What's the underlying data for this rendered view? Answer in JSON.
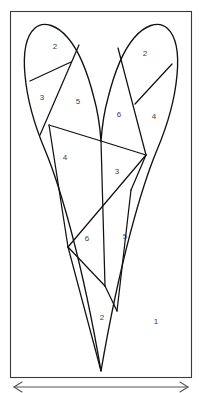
{
  "figure": {
    "canvas": {
      "width": 202,
      "height": 393
    },
    "frame": {
      "x": 10,
      "y": 11,
      "width": 182,
      "height": 367,
      "stroke": "#3a3a3a"
    },
    "colors": {
      "background": "#ffffff",
      "outline": "#111111",
      "cut_line": "#111111",
      "label_text": "#3c3c46",
      "frame": "#3a3a3a",
      "scale_arrow": "#555555"
    },
    "piece_labels": [
      {
        "id": "piece-1",
        "text": "1",
        "x": 156,
        "y": 322
      },
      {
        "id": "piece-2-left",
        "text": "2",
        "x": 55,
        "y": 47
      },
      {
        "id": "piece-3-left",
        "text": "3",
        "x": 42,
        "y": 98
      },
      {
        "id": "piece-5-left",
        "text": "5",
        "x": 78,
        "y": 102
      },
      {
        "id": "piece-2-right",
        "text": "2",
        "x": 145,
        "y": 54
      },
      {
        "id": "piece-6-upper",
        "text": "6",
        "x": 119,
        "y": 115
      },
      {
        "id": "piece-4-right",
        "text": "4",
        "x": 154,
        "y": 117
      },
      {
        "id": "piece-4-lower",
        "text": "4",
        "x": 65,
        "y": 158
      },
      {
        "id": "piece-3-lower",
        "text": "3",
        "x": 117,
        "y": 172
      },
      {
        "id": "piece-6-lower",
        "text": "6",
        "x": 87,
        "y": 239
      },
      {
        "id": "piece-5-lower",
        "text": "5",
        "x": 125,
        "y": 237
      },
      {
        "id": "piece-2-bottom",
        "text": "2",
        "x": 102,
        "y": 318
      }
    ],
    "scale_bar": {
      "y": 386,
      "x_start": 14,
      "x_end": 188,
      "label": ""
    }
  }
}
